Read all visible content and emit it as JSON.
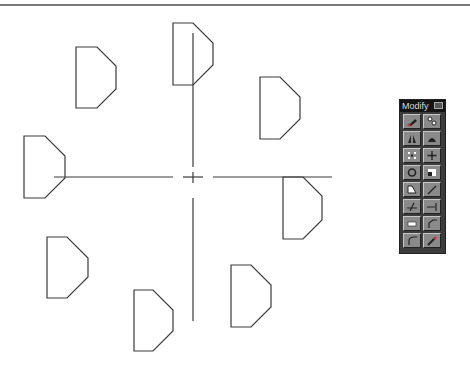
{
  "toolbar": {
    "title": "Modify",
    "buttons": [
      {
        "name": "erase",
        "icon": "eraser-icon"
      },
      {
        "name": "copy",
        "icon": "copy-object-icon"
      },
      {
        "name": "mirror",
        "icon": "mirror-icon"
      },
      {
        "name": "offset",
        "icon": "offset-icon"
      },
      {
        "name": "array",
        "icon": "array-icon"
      },
      {
        "name": "move",
        "icon": "move-icon"
      },
      {
        "name": "rotate",
        "icon": "rotate-icon"
      },
      {
        "name": "scale",
        "icon": "scale-icon"
      },
      {
        "name": "stretch",
        "icon": "stretch-icon"
      },
      {
        "name": "lengthen",
        "icon": "lengthen-icon"
      },
      {
        "name": "trim",
        "icon": "trim-icon"
      },
      {
        "name": "extend",
        "icon": "extend-icon"
      },
      {
        "name": "break",
        "icon": "break-icon"
      },
      {
        "name": "chamfer",
        "icon": "chamfer-icon"
      },
      {
        "name": "fillet",
        "icon": "fillet-icon"
      },
      {
        "name": "explode",
        "icon": "explode-icon"
      }
    ]
  },
  "drawing": {
    "line_color": "#3a3a3a",
    "shapes": [
      {
        "x": 173,
        "y": 23,
        "w": 20,
        "dx": 20,
        "h": 62
      },
      {
        "x": 76,
        "y": 47,
        "w": 21,
        "dx": 19,
        "h": 61
      },
      {
        "x": 260,
        "y": 77,
        "w": 20,
        "dx": 20,
        "h": 62
      },
      {
        "x": 24,
        "y": 136,
        "w": 21,
        "dx": 20,
        "h": 62
      },
      {
        "x": 283,
        "y": 177,
        "w": 20,
        "dx": 19,
        "h": 62
      },
      {
        "x": 47,
        "y": 237,
        "w": 20,
        "dx": 21,
        "h": 61
      },
      {
        "x": 231,
        "y": 265,
        "w": 20,
        "dx": 20,
        "h": 62
      },
      {
        "x": 134,
        "y": 290,
        "w": 19,
        "dx": 20,
        "h": 61
      }
    ],
    "center": {
      "x": 193,
      "y": 177
    }
  }
}
